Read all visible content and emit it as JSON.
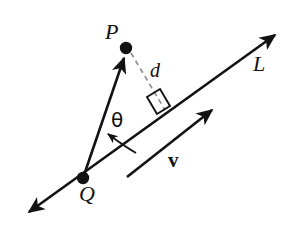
{
  "figure": {
    "background_color": "#ffffff",
    "stroke_color": "#121212",
    "dash_color": "#8a8a8a",
    "labels": {
      "point_p": "P",
      "point_q": "Q",
      "line_l": "L",
      "distance_d": "d",
      "angle_theta": "θ",
      "vector_v": "v"
    },
    "geometry": {
      "point_p": {
        "x": 126,
        "y": 48
      },
      "point_q": {
        "x": 83,
        "y": 178
      },
      "line_l_start": {
        "x": 26,
        "y": 215
      },
      "line_l_end": {
        "x": 278,
        "y": 32
      },
      "foot_of_perpendicular": {
        "x": 163,
        "y": 110
      },
      "vector_v_start": {
        "x": 127,
        "y": 177
      },
      "vector_v_end": {
        "x": 216,
        "y": 107
      },
      "angle_arc_start": {
        "x": 134,
        "y": 152
      },
      "angle_arc_end": {
        "x": 105,
        "y": 133
      },
      "right_angle_marker": {
        "x": 155,
        "y": 101
      }
    }
  }
}
